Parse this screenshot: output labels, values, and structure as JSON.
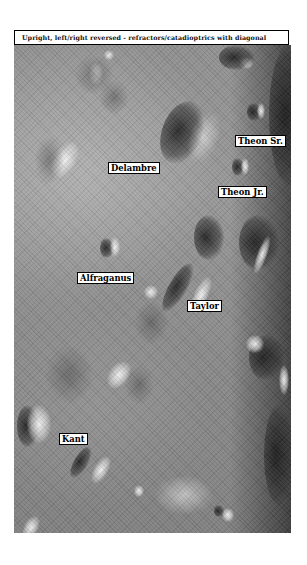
{
  "header": {
    "caption": "Upright, left/right reversed - refractors/catadioptrics with diagonal"
  },
  "map": {
    "type": "lunar-surface",
    "view": "grayscale",
    "labels": [
      {
        "name": "Theon Sr.",
        "x": 235,
        "y": 135
      },
      {
        "name": "Delambre",
        "x": 108,
        "y": 162
      },
      {
        "name": "Theon Jr.",
        "x": 218,
        "y": 186
      },
      {
        "name": "Alfraganus",
        "x": 77,
        "y": 272
      },
      {
        "name": "Taylor",
        "x": 187,
        "y": 300
      },
      {
        "name": "Kant",
        "x": 59,
        "y": 433
      }
    ]
  },
  "colors": {
    "label_bg": "#ffffff",
    "label_border": "#000000",
    "surface_mid": "#8e8e8e"
  }
}
